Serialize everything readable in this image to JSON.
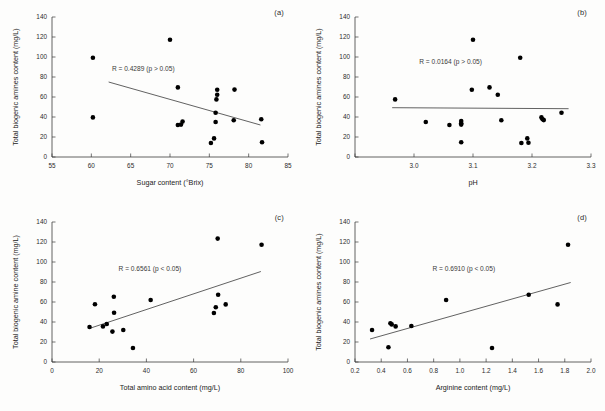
{
  "figure": {
    "panel_labels": [
      "(a)",
      "(b)",
      "(c)",
      "(d)"
    ]
  },
  "chart_data": [
    {
      "type": "scatter",
      "panel": "(a)",
      "title": "",
      "xlabel": "Sugar content (°Brix)",
      "ylabel": "Total biogenic amines content (mg/L)",
      "xlim": [
        55,
        85
      ],
      "ylim": [
        0,
        140
      ],
      "xticks": [
        55,
        60,
        65,
        70,
        75,
        80,
        85
      ],
      "xticklabels": [
        "55",
        "60",
        "65",
        "70",
        "75",
        "80",
        "85"
      ],
      "yticks": [
        0,
        20,
        40,
        60,
        80,
        100,
        120,
        140
      ],
      "yticklabels": [
        "0",
        "20",
        "40",
        "60",
        "80",
        "100",
        "120",
        "140"
      ],
      "grid": false,
      "legend": "none",
      "annotation": "R = 0.4289 (p > 0.05)",
      "annotation_x": 66.6,
      "annotation_y": 86,
      "trendline": {
        "x0": 62.2,
        "y0": 75,
        "x1": 81.5,
        "y1": 32
      },
      "x": [
        60.2,
        60.2,
        70.0,
        71.0,
        71.0,
        71.4,
        71.6,
        75.2,
        75.6,
        75.8,
        75.8,
        75.9,
        76.0,
        76.0,
        78.1,
        78.2,
        81.6,
        81.7
      ],
      "y": [
        99.3,
        39.6,
        117.3,
        69.6,
        32.0,
        32.4,
        35.4,
        14.0,
        18.6,
        35.0,
        44.2,
        57.6,
        67.2,
        62.3,
        36.7,
        67.4,
        37.8,
        14.8
      ]
    },
    {
      "type": "scatter",
      "panel": "(b)",
      "title": "",
      "xlabel": "pH",
      "ylabel": "Total biogenic amines content (mg/L)",
      "xlim": [
        2.9,
        3.3
      ],
      "ylim": [
        0,
        140
      ],
      "xticks": [
        2.9,
        3.0,
        3.1,
        3.2,
        3.3
      ],
      "xticklabels": [
        "",
        "3.0",
        "3.1",
        "3.2",
        "3.3"
      ],
      "yticks": [
        0,
        20,
        40,
        60,
        80,
        100,
        120,
        140
      ],
      "yticklabels": [
        "0",
        "20",
        "40",
        "60",
        "80",
        "100",
        "120",
        "140"
      ],
      "grid": false,
      "legend": "none",
      "annotation": "R = 0.0164 (p > 0.05)",
      "annotation_x": 3.062,
      "annotation_y": 93,
      "trendline": {
        "x0": 2.963,
        "y0": 49.3,
        "x1": 3.262,
        "y1": 48.3
      },
      "x": [
        2.968,
        3.02,
        3.06,
        3.08,
        3.08,
        3.08,
        3.08,
        3.098,
        3.1,
        3.128,
        3.142,
        3.148,
        3.18,
        3.182,
        3.192,
        3.194,
        3.216,
        3.218,
        3.22,
        3.25
      ],
      "y": [
        57.6,
        35.0,
        32.0,
        36.0,
        33.8,
        32.4,
        14.8,
        67.2,
        117.3,
        69.6,
        62.3,
        36.7,
        99.3,
        14.0,
        18.6,
        14.2,
        39.6,
        37.8,
        36.9,
        44.2
      ]
    },
    {
      "type": "scatter",
      "panel": "(c)",
      "title": "",
      "xlabel": "Total amino acid content (mg/L)",
      "ylabel": "Total biogenic amine content (mg/L)",
      "xlim": [
        0,
        100
      ],
      "ylim": [
        0,
        140
      ],
      "xticks": [
        0,
        20,
        40,
        60,
        80,
        100
      ],
      "xticklabels": [
        "0",
        "20",
        "40",
        "60",
        "80",
        "100"
      ],
      "yticks": [
        0,
        20,
        40,
        60,
        80,
        100,
        120,
        140
      ],
      "yticklabels": [
        "0",
        "20",
        "40",
        "60",
        "80",
        "100",
        "120",
        "140"
      ],
      "grid": false,
      "legend": "none",
      "annotation": "R = 0.6561 (p < 0.05)",
      "annotation_x": 41.5,
      "annotation_y": 91,
      "trendline": {
        "x0": 15.8,
        "y0": 33.5,
        "x1": 88.5,
        "y1": 90.5
      },
      "x": [
        15.9,
        18.2,
        21.6,
        23.2,
        25.6,
        26.2,
        26.3,
        30.2,
        34.3,
        41.8,
        68.6,
        69.4,
        70.2,
        70.4,
        73.6,
        88.8
      ],
      "y": [
        35.0,
        57.8,
        35.6,
        38.0,
        30.4,
        65.2,
        49.2,
        32.0,
        14.0,
        62.0,
        49.0,
        54.8,
        123.4,
        67.2,
        57.6,
        117.3
      ]
    },
    {
      "type": "scatter",
      "panel": "(d)",
      "title": "",
      "xlabel": "Arginine content (mg/L)",
      "ylabel": "Total biogenic amines content (mg/L)",
      "xlim": [
        0.2,
        2.0
      ],
      "ylim": [
        0,
        140
      ],
      "xticks": [
        0.2,
        0.4,
        0.6,
        0.8,
        1.0,
        1.2,
        1.4,
        1.6,
        1.8,
        2.0
      ],
      "xticklabels": [
        "0.2",
        "0.4",
        "0.6",
        "0.8",
        "1.0",
        "1.2",
        "1.4",
        "1.6",
        "1.8",
        "2.0"
      ],
      "yticks": [
        0,
        20,
        40,
        60,
        80,
        100,
        120,
        140
      ],
      "yticklabels": [
        "0",
        "20",
        "40",
        "60",
        "80",
        "100",
        "120",
        "140"
      ],
      "grid": false,
      "legend": "none",
      "annotation": "R = 0.6910 (p < 0.05)",
      "annotation_x": 1.03,
      "annotation_y": 91,
      "trendline": {
        "x0": 0.315,
        "y0": 23.0,
        "x1": 1.845,
        "y1": 79.5
      },
      "x": [
        0.33,
        0.455,
        0.47,
        0.48,
        0.51,
        0.63,
        0.895,
        1.245,
        1.525,
        1.745,
        1.825
      ],
      "y": [
        32.0,
        14.8,
        38.8,
        37.6,
        35.6,
        36.0,
        62.0,
        14.0,
        67.2,
        57.6,
        117.3
      ]
    }
  ]
}
